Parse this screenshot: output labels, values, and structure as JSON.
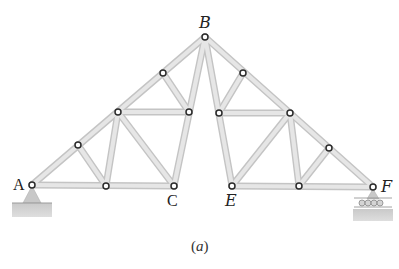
{
  "figure": {
    "caption_open": "(",
    "caption_letter": "a",
    "caption_close": ")",
    "labels": {
      "A": "A",
      "B": "B",
      "C": "C",
      "E": "E",
      "F": "F"
    },
    "colors": {
      "member": "#e6e6e6",
      "member_edge": "#c4c4c4",
      "joint_stroke": "#2b2b2b",
      "support": "#bdbdbd"
    },
    "supports": {
      "A": "pin",
      "F": "roller"
    }
  }
}
